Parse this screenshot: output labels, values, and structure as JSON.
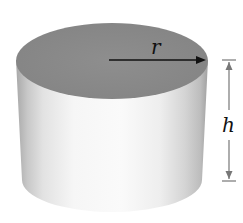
{
  "diagram": {
    "shape": "cylinder",
    "labels": {
      "radius": "r",
      "height": "h"
    },
    "colors": {
      "top_face": "#8a8a8a",
      "side_light": "#f4f4f4",
      "side_dark": "#b5b5b5",
      "arrow": "#111111",
      "dimension_line": "#777777"
    }
  }
}
